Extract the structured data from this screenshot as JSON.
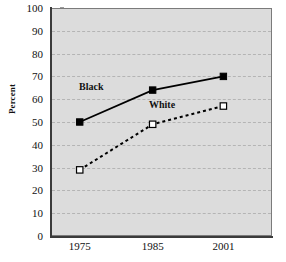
{
  "chart_data": {
    "type": "line",
    "title": "",
    "xlabel": "",
    "ylabel": "Percent",
    "categories": [
      "1975",
      "1985",
      "2001"
    ],
    "ylim": [
      0,
      100
    ],
    "yticks": [
      0,
      10,
      20,
      30,
      40,
      50,
      60,
      70,
      80,
      90,
      100
    ],
    "grid": true,
    "legend_position": "inline-annotations",
    "series": [
      {
        "name": "Black",
        "values": [
          50,
          64,
          70
        ],
        "marker": "filled-square",
        "line_style": "solid",
        "color": "#000000"
      },
      {
        "name": "White",
        "values": [
          29,
          49,
          57
        ],
        "marker": "open-square",
        "line_style": "dashed",
        "color": "#000000"
      }
    ],
    "annotations": [
      {
        "text": "Black",
        "series": "Black"
      },
      {
        "text": "White",
        "series": "White"
      }
    ]
  },
  "axes": {
    "y_title": "Percent",
    "y_tick_labels": [
      "100",
      "90",
      "80",
      "70",
      "60",
      "50",
      "40",
      "30",
      "20",
      "10",
      "0"
    ],
    "x_tick_labels": [
      "1975",
      "1985",
      "2001"
    ]
  },
  "style": {
    "plot_background": "#dcdcdc",
    "grid_color": "#b4b4b4",
    "axis_color": "#3b3b3b",
    "series_color": "#000000",
    "page_background": "#ffffff"
  }
}
